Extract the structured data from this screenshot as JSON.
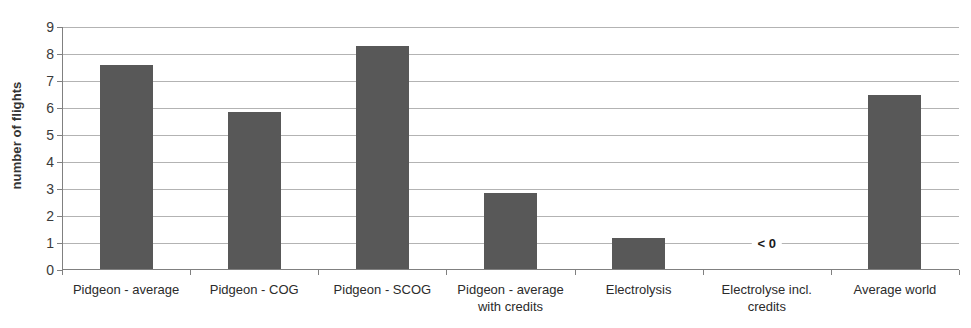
{
  "chart_data": {
    "type": "bar",
    "title": "",
    "subtitle": "",
    "xlabel": "",
    "ylabel": "number of flights",
    "ylim": [
      0,
      9
    ],
    "ytick_step": 1,
    "yticks": [
      "9",
      "8",
      "7",
      "6",
      "5",
      "4",
      "3",
      "2",
      "1",
      "0"
    ],
    "grid": true,
    "legend": false,
    "categories": [
      "Pidgeon - average",
      "Pidgeon - COG",
      "Pidgeon - SCOG",
      "Pidgeon - average\nwith credits",
      "Electrolysis",
      "Electrolyse incl.\ncredits",
      "Average world"
    ],
    "values": [
      7.6,
      5.85,
      8.3,
      2.85,
      1.2,
      null,
      6.5
    ],
    "annotations": [
      {
        "text": "< 0",
        "category_index": 5,
        "y": 1.0
      }
    ],
    "colors": {
      "bar": "#585858",
      "gridline": "#b3b3b3",
      "axis": "#808080",
      "text": "#2b2b2b",
      "background": "#ffffff"
    }
  }
}
